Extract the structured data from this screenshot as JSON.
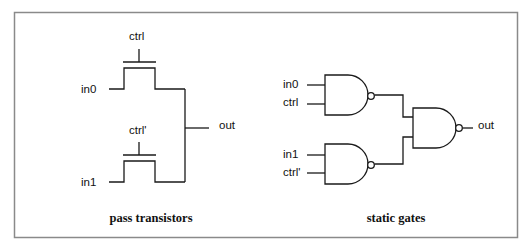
{
  "figure": {
    "panels": [
      {
        "id": "pass-transistors",
        "caption": "pass transistors",
        "labels": {
          "in0": "in0",
          "in1": "in1",
          "ctrl": "ctrl",
          "ctrl_bar": "ctrl'",
          "out": "out"
        }
      },
      {
        "id": "static-gates",
        "caption": "static gates",
        "labels": {
          "in0": "in0",
          "ctrl": "ctrl",
          "in1": "in1",
          "ctrl_bar": "ctrl'",
          "out": "out"
        }
      }
    ],
    "colors": {
      "line": "#1a1a1a",
      "frame": "#8a8a8a",
      "background": "#ffffff"
    }
  }
}
